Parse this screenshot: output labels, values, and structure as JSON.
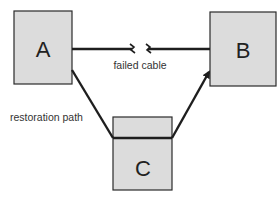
{
  "diagram": {
    "nodes": [
      {
        "id": "A",
        "label": "A"
      },
      {
        "id": "B",
        "label": "B"
      },
      {
        "id": "C",
        "label": "C"
      }
    ],
    "edges": [
      {
        "from": "A",
        "to": "B",
        "label": "failed cable",
        "status": "failed"
      },
      {
        "from": "A",
        "to": "C",
        "label": "restoration path",
        "status": "active"
      },
      {
        "from": "C",
        "to": "B",
        "label": "",
        "status": "active",
        "arrow": true
      }
    ],
    "colors": {
      "box_fill": "#dcdcdc",
      "line": "#1e1e1e"
    }
  }
}
